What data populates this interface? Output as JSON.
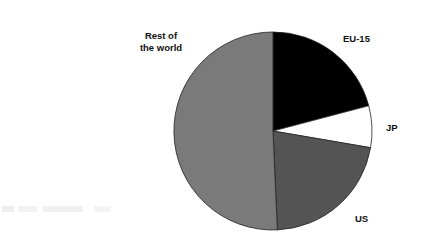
{
  "chart_data": {
    "type": "pie",
    "title": "",
    "start_angle_deg": 0,
    "direction": "clockwise",
    "categories": [
      "EU-15",
      "JP",
      "US",
      "Rest of the world"
    ],
    "values": [
      20.9,
      6.8,
      21.6,
      50.7
    ],
    "unit": "% share (estimated from slice angles)",
    "colors": [
      "#000000",
      "#ffffff",
      "#545454",
      "#7a7a7a"
    ],
    "labels": {
      "eu15": "EU-15",
      "jp": "JP",
      "us": "US",
      "row_line1": "Rest of",
      "row_line2": "the world"
    },
    "legend": "none (direct labels)"
  }
}
